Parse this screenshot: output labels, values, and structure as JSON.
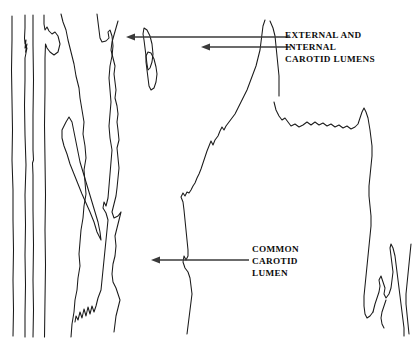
{
  "figure": {
    "kind": "anatomical-line-drawing",
    "width": 420,
    "height": 341,
    "background_color": "#ffffff",
    "ink_color": "#1a1a1a",
    "arrow_color": "#3a3a3a"
  },
  "annotations": [
    {
      "id": "external-internal-carotid-lumens",
      "text": "EXTERNAL AND\nINTERNAL\nCAROTID LUMENS",
      "lines": [
        "EXTERNAL AND",
        "INTERNAL",
        "CAROTID LUMENS"
      ],
      "label_x": 285,
      "label_y": 29,
      "arrows": [
        {
          "from_x": 290,
          "from_y": 37,
          "to_x": 126,
          "to_y": 37,
          "direction": "left"
        },
        {
          "from_x": 290,
          "from_y": 47,
          "to_x": 201,
          "to_y": 47,
          "direction": "left"
        }
      ]
    },
    {
      "id": "common-carotid-lumen",
      "text": "COMMON\nCAROTID\nLUMEN",
      "lines": [
        "COMMON",
        "CAROTID",
        "LUMEN"
      ],
      "label_x": 252,
      "label_y": 243,
      "arrows": [
        {
          "from_x": 249,
          "from_y": 260,
          "to_x": 151,
          "to_y": 260,
          "direction": "left"
        }
      ]
    }
  ],
  "traced_outlines": {
    "count": 9,
    "description": "Hand-traced vessel wall and lumen boundary contours"
  }
}
